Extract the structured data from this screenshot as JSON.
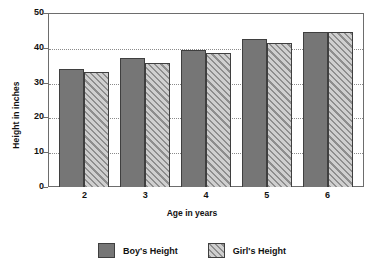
{
  "chart_data": {
    "type": "bar",
    "title": "",
    "xlabel": "Age in years",
    "ylabel": "Height in inches",
    "categories": [
      "2",
      "3",
      "4",
      "5",
      "6"
    ],
    "series": [
      {
        "name": "Boy's Height",
        "values": [
          34,
          37,
          39.5,
          42.5,
          44.5
        ],
        "style": "solid",
        "color": "#767676"
      },
      {
        "name": "Girl's Height",
        "values": [
          33,
          35.5,
          38.5,
          41.5,
          44.5
        ],
        "style": "diagonal-hatch",
        "color": "#8e8e8e"
      }
    ],
    "ylim": [
      0,
      50
    ],
    "yticks": [
      0,
      10,
      20,
      30,
      40,
      50
    ],
    "grid": "horizontal-dotted",
    "legend_position": "bottom-center",
    "background": "#ffffff",
    "axis_color": "#6d6d6d",
    "text_color": "#111111"
  }
}
